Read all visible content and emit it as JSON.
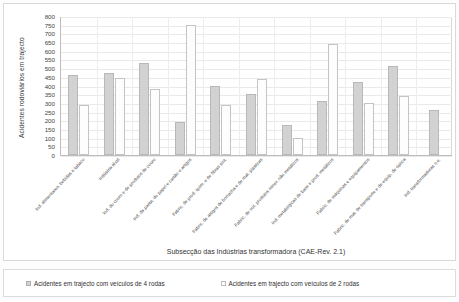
{
  "chart_data": {
    "type": "bar",
    "title": "",
    "xlabel": "Subsecção das Indústrias transformadora (CAE-Rev. 2.1)",
    "ylabel": "Acidentes rodoviários em trajecto",
    "ylim": [
      0,
      800
    ],
    "ytick_step": 50,
    "yticks": [
      "800",
      "750",
      "700",
      "650",
      "600",
      "550",
      "500",
      "450",
      "400",
      "350",
      "300",
      "250",
      "200",
      "150",
      "100",
      "50",
      "0"
    ],
    "grid": true,
    "legend_position": "bottom",
    "categories": [
      "Ind. alimentares, bebidas e tabaco",
      "Indústria têxtil",
      "Ind. do couro e de produtos de couro",
      "Ind. da pasta, do papel e cartão e artigos",
      "Fabric. de prod. quím. e de fibras sint.",
      "Fabric. de artigos de borracha e de mat. plásticas",
      "Fabric. de out. produtos miner. não metálicos",
      "Ind. metalúrgicas de base e prod. metálicos",
      "Fabric. de máquinas e equipamentos",
      "Fabric. de mat. de transporte e de equip. de óptica",
      "Ind. transformadoras n.e."
    ],
    "series": [
      {
        "name": "Acidentes em trajecto com veículos de 4 rodas",
        "color": "#d2d2d2",
        "values": [
          460,
          470,
          530,
          190,
          400,
          350,
          170,
          310,
          420,
          510,
          260
        ]
      },
      {
        "name": "Acidentes em trajecto com veículos de 2 rodas",
        "color": "#ffffff",
        "values": [
          285,
          445,
          380,
          750,
          285,
          440,
          100,
          640,
          300,
          340,
          0
        ]
      }
    ]
  },
  "legend": {
    "items": [
      {
        "label": "Acidentes em trajecto com veículos de 4 rodas"
      },
      {
        "label": "Acidentes em trajecto com veículos de 2 rodas"
      }
    ]
  }
}
